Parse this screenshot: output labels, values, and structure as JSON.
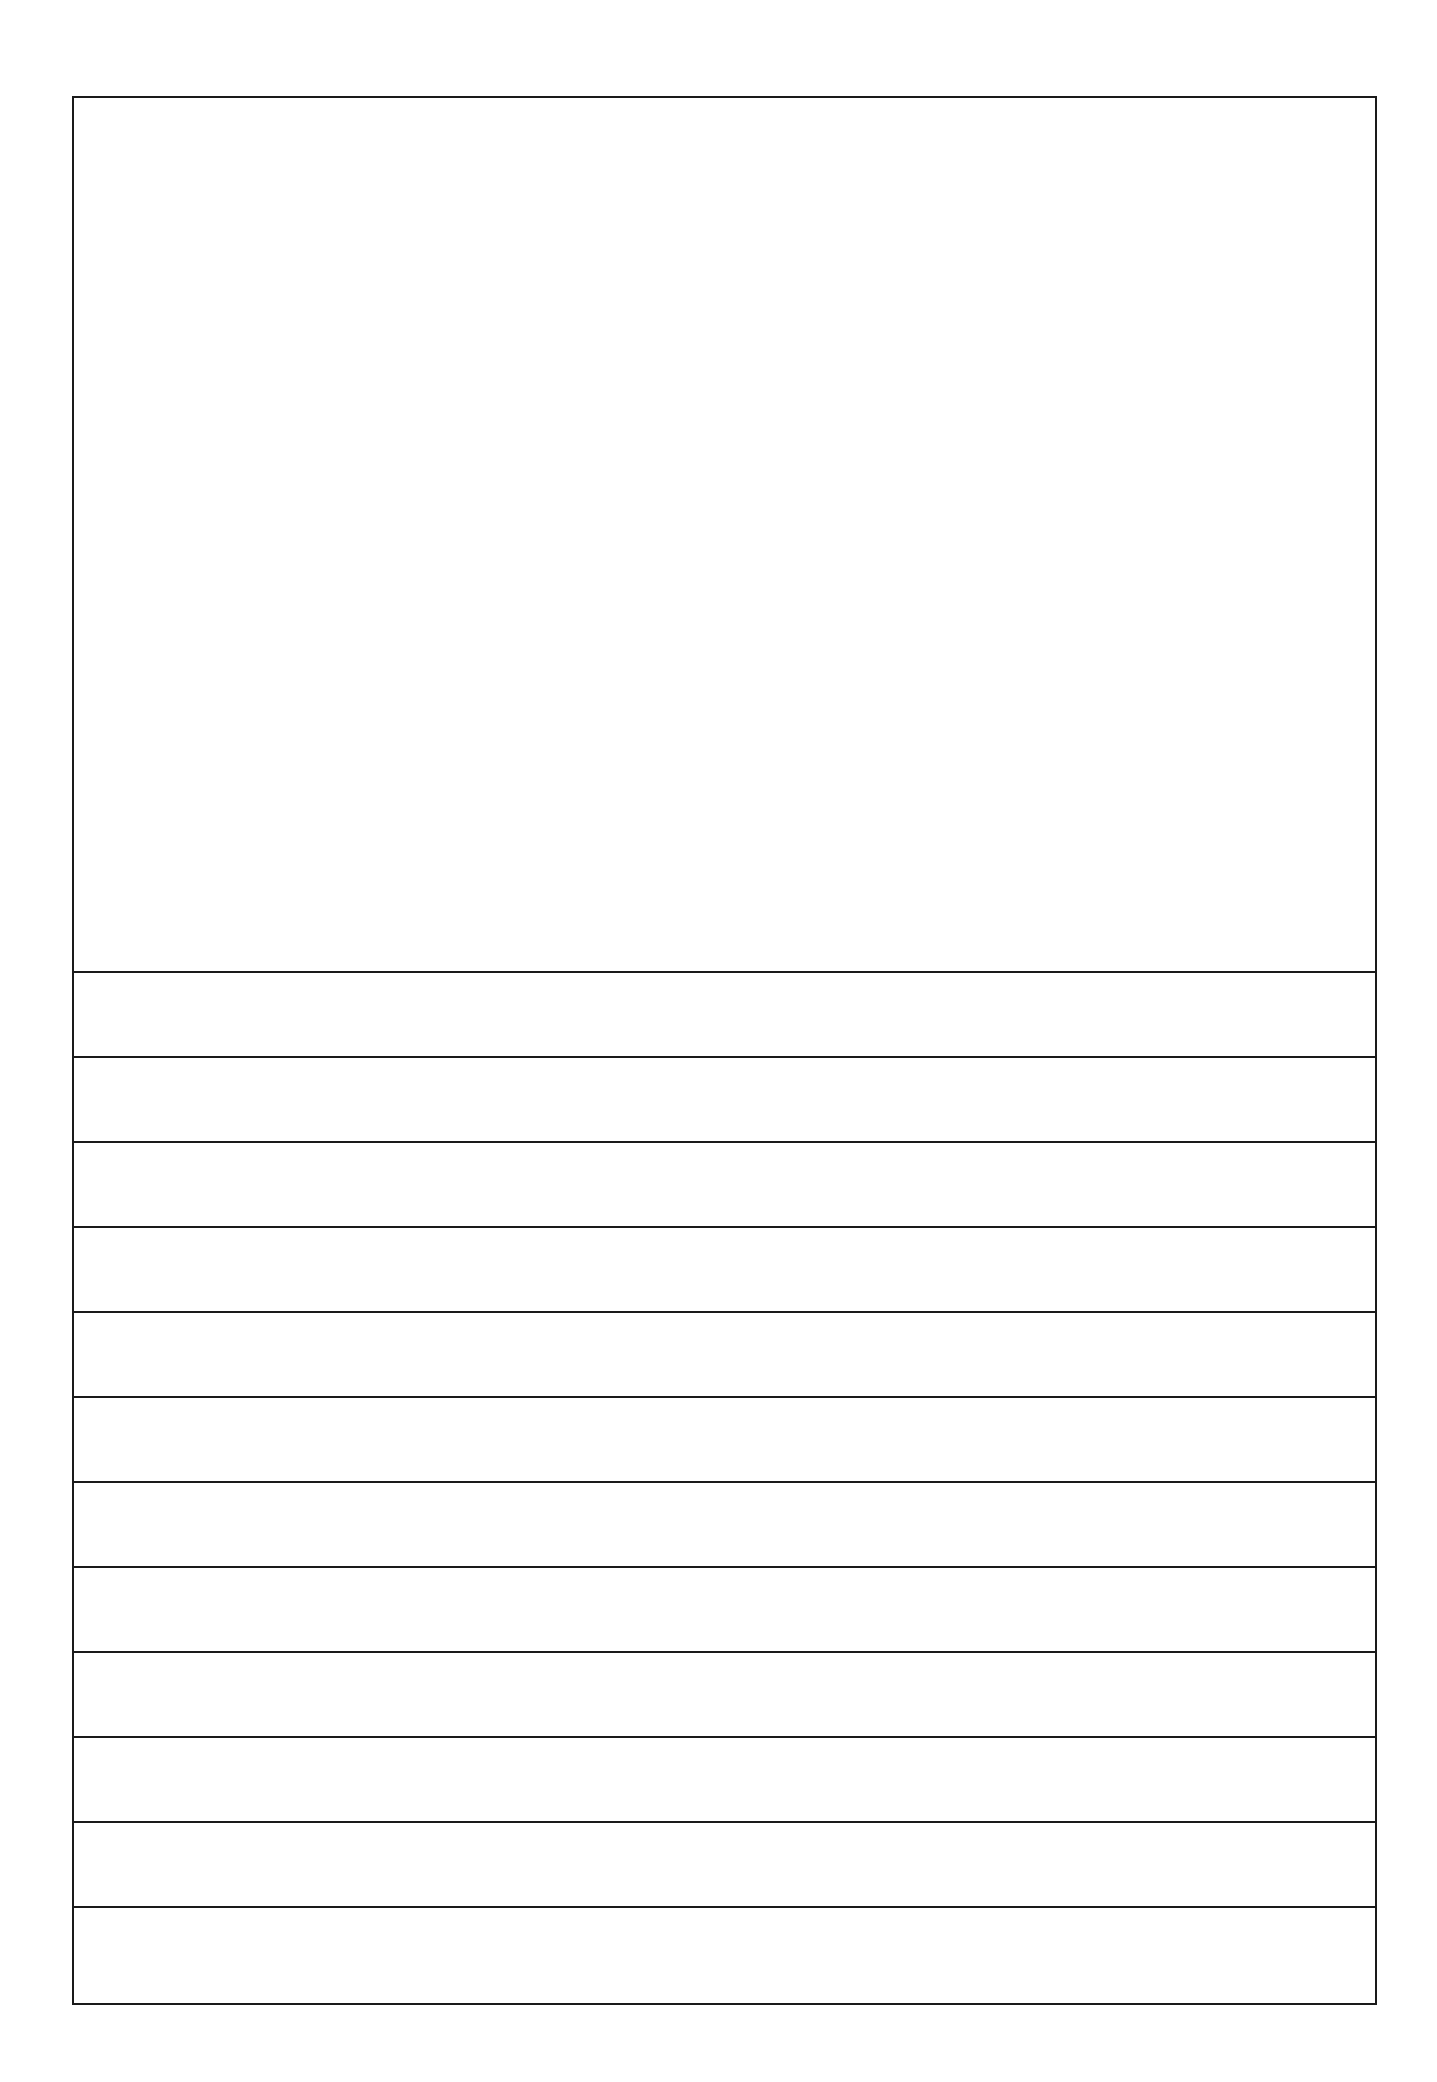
{
  "document": {
    "kind": "blank-ruled-form",
    "page_background": "#ffffff",
    "ink_color": "#1a1a1a",
    "header_cell_text": "",
    "rows": [
      {
        "text": ""
      },
      {
        "text": ""
      },
      {
        "text": ""
      },
      {
        "text": ""
      },
      {
        "text": ""
      },
      {
        "text": ""
      },
      {
        "text": ""
      },
      {
        "text": ""
      },
      {
        "text": ""
      },
      {
        "text": ""
      },
      {
        "text": ""
      },
      {
        "text": ""
      }
    ]
  }
}
